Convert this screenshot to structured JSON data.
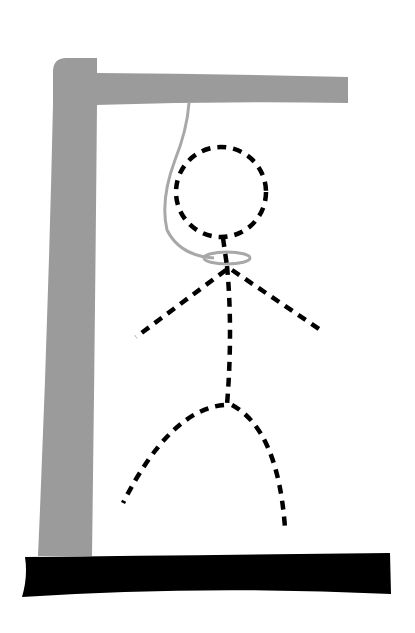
{
  "image": {
    "description": "Hangman drawing",
    "width": 415,
    "height": 633
  },
  "colors": {
    "background": "#ffffff",
    "gallows": "#9b9b9b",
    "rope": "#a8a8a8",
    "figure": "#000000",
    "base": "#000000"
  },
  "gallows": {
    "post": "gray vertical post",
    "beam": "gray horizontal beam",
    "base": "black ground slab"
  },
  "rope": {
    "noose": "gray loop around neck"
  },
  "figure": {
    "style": "dashed stick figure",
    "parts": [
      "head",
      "body",
      "left-arm",
      "right-arm",
      "left-leg",
      "right-leg"
    ]
  }
}
